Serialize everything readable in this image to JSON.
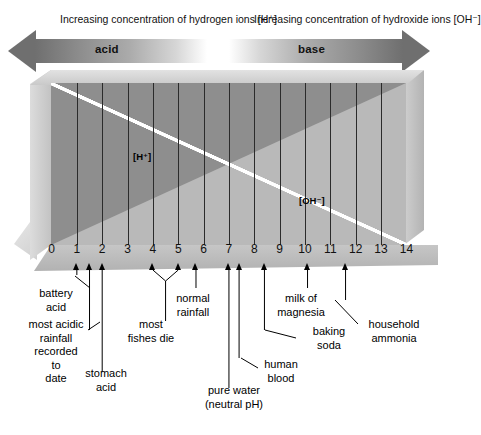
{
  "header": {
    "acid_caption": "Increasing concentration\nof hydrogen ions [H⁺]",
    "base_caption": "Increasing concentration\nof hydroxide ions [OH⁻]",
    "acid_word": "acid",
    "base_word": "base"
  },
  "slab": {
    "h_ion_label": "[H⁺]",
    "oh_ion_label": "[OH⁻]",
    "front_dark_color": "#8e8e8e",
    "front_light_color": "#b9b9b9",
    "divider_color": "#ffffff"
  },
  "axis": {
    "ticks": [
      "0",
      "1",
      "2",
      "3",
      "4",
      "5",
      "6",
      "7",
      "8",
      "9",
      "10",
      "11",
      "12",
      "13",
      "14"
    ],
    "min": 0,
    "max": 14
  },
  "callouts": [
    {
      "label": "battery\nacid",
      "ph": 1.0
    },
    {
      "label": "most acidic\nrainfall\nrecorded\nto\ndate",
      "ph": 1.5
    },
    {
      "label": "stomach\nacid",
      "ph": 2.0
    },
    {
      "label": "most\nfishes die",
      "ph": 4.5,
      "span": [
        4.0,
        5.0
      ]
    },
    {
      "label": "normal\nrainfall",
      "ph": 5.7
    },
    {
      "label": "pure water\n(neutral pH)",
      "ph": 7.0
    },
    {
      "label": "human\nblood",
      "ph": 7.4
    },
    {
      "label": "baking\nsoda",
      "ph": 8.4
    },
    {
      "label": "milk of\nmagnesia",
      "ph": 10.1
    },
    {
      "label": "household\nammonia",
      "ph": 11.6
    }
  ],
  "chart_data": {
    "type": "bar",
    "xlabel": "pH",
    "ylabel": "",
    "xlim": [
      0,
      14
    ],
    "grid": true,
    "categories": [
      "0",
      "1",
      "2",
      "3",
      "4",
      "5",
      "6",
      "7",
      "8",
      "9",
      "10",
      "11",
      "12",
      "13",
      "14"
    ],
    "series": [
      {
        "name": "[H+] relative concentration",
        "values": [
          14,
          13,
          12,
          11,
          10,
          9,
          8,
          7,
          6,
          5,
          4,
          3,
          2,
          1,
          0
        ]
      },
      {
        "name": "[OH-] relative concentration",
        "values": [
          0,
          1,
          2,
          3,
          4,
          5,
          6,
          7,
          8,
          9,
          10,
          11,
          12,
          13,
          14
        ]
      }
    ],
    "annotations": [
      {
        "text": "battery acid",
        "x": 1.0
      },
      {
        "text": "most acidic rainfall recorded to date",
        "x": 1.5
      },
      {
        "text": "stomach acid",
        "x": 2.0
      },
      {
        "text": "most fishes die",
        "x": 4.5
      },
      {
        "text": "normal rainfall",
        "x": 5.7
      },
      {
        "text": "pure water (neutral pH)",
        "x": 7.0
      },
      {
        "text": "human blood",
        "x": 7.4
      },
      {
        "text": "baking soda",
        "x": 8.4
      },
      {
        "text": "milk of magnesia",
        "x": 10.1
      },
      {
        "text": "household ammonia",
        "x": 11.6
      }
    ],
    "legend": [
      "acid",
      "base"
    ],
    "legend_position": "top"
  }
}
